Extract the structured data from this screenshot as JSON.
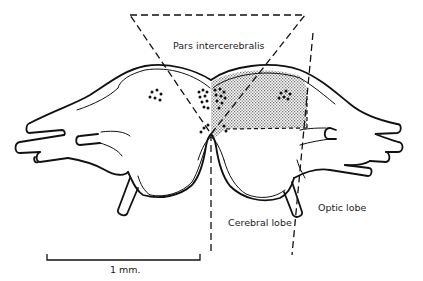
{
  "figure": {
    "type": "anatomical-line-drawing",
    "labels": {
      "pars_intercerebralis": "Pars intercerebralis",
      "cerebral_lobe": "Cerebral lobe",
      "optic_lobe": "Optic lobe"
    },
    "scale_bar": {
      "label": "1 mm."
    },
    "colors": {
      "ink": "#111111",
      "stipple": "#8a8a8a",
      "background": "#ffffff"
    }
  }
}
